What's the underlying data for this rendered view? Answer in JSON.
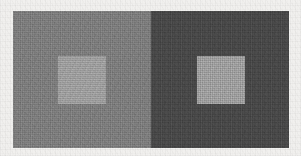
{
  "figure": {
    "name": "simultaneous-contrast-illusion",
    "width": 301,
    "height": 156,
    "background_color": "#f1f0ee",
    "caption": "",
    "title": ""
  },
  "stimulus": {
    "x": 13,
    "y": 11,
    "width": 276,
    "height": 137,
    "divider_x": 151
  },
  "panels": [
    {
      "id": "panel-light",
      "label": "",
      "surround_color": "#7d7d7d",
      "width": 138,
      "inner_square": {
        "id": "square-on-light",
        "label": "",
        "color": "#a0a0a0",
        "size": 48,
        "x": 45,
        "y": 45
      }
    },
    {
      "id": "panel-dark",
      "label": "",
      "surround_color": "#474747",
      "width": 138,
      "inner_square": {
        "id": "square-on-dark",
        "label": "",
        "color": "#a0a0a0",
        "size": 48,
        "x": 46,
        "y": 45
      }
    }
  ],
  "colors": {
    "paper": "#f1f0ee",
    "light_surround": "#7d7d7d",
    "dark_surround": "#474747",
    "target_patch": "#a0a0a0"
  }
}
